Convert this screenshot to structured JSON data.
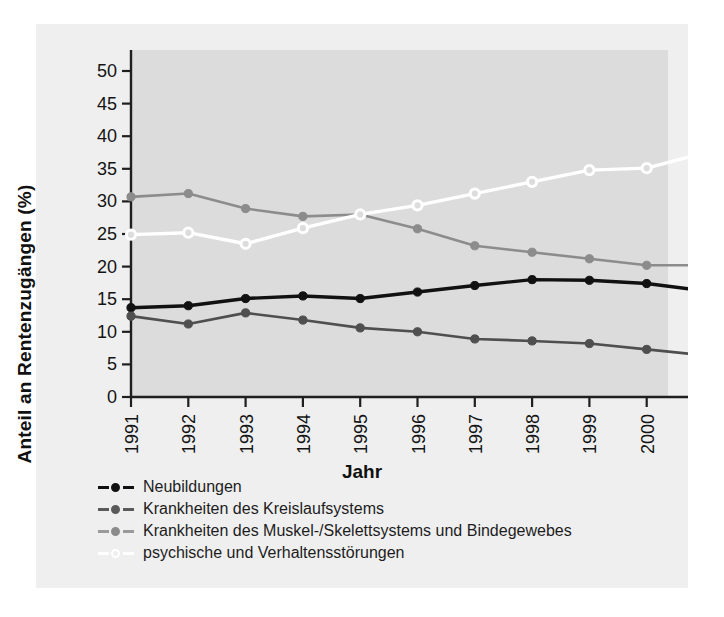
{
  "chart_data": {
    "type": "line",
    "title": "",
    "xlabel": "Jahr",
    "ylabel": "Anteil an Rentenzugängen (%)",
    "x": [
      1991,
      1992,
      1993,
      1994,
      1995,
      1996,
      1997,
      1998,
      1999,
      2000,
      2001
    ],
    "xticklabels": [
      "1991",
      "1992",
      "1993",
      "1994",
      "1995",
      "1996",
      "1997",
      "1998",
      "1999",
      "2000",
      "2001"
    ],
    "yticklabels": [
      "0",
      "5",
      "10",
      "15",
      "20",
      "25",
      "30",
      "35",
      "40",
      "45",
      "50"
    ],
    "yticks": [
      0,
      5,
      10,
      15,
      20,
      25,
      30,
      35,
      40,
      45,
      50
    ],
    "ylim": [
      0,
      50
    ],
    "grid": false,
    "legend_position": "below-axes",
    "series": [
      {
        "name": "Neubildungen",
        "color": "#111111",
        "marker": "filled-circle",
        "values": [
          13.7,
          14.0,
          15.1,
          15.5,
          15.1,
          16.1,
          17.1,
          18.0,
          17.9,
          17.4,
          16.3
        ]
      },
      {
        "name": "Krankheiten des Kreislaufsystems",
        "color": "#4f4f4f",
        "marker": "filled-circle",
        "values": [
          12.4,
          11.2,
          12.9,
          11.8,
          10.6,
          10.0,
          8.9,
          8.6,
          8.2,
          7.3,
          6.4
        ]
      },
      {
        "name": "Krankheiten des Muskel-/Skelettsystems und Bindegewebes",
        "color": "#8c8c8c",
        "marker": "filled-circle",
        "values": [
          30.7,
          31.2,
          28.9,
          27.7,
          28.0,
          25.8,
          23.2,
          22.2,
          21.2,
          20.2,
          20.2
        ]
      },
      {
        "name": "psychische und Verhaltensstörungen",
        "color": "#ffffff",
        "marker": "hollow-circle",
        "values": [
          24.9,
          25.2,
          23.5,
          25.9,
          28.0,
          29.4,
          31.2,
          33.0,
          34.8,
          35.1,
          37.4
        ]
      }
    ]
  },
  "legend": {
    "items": [
      "Neubildungen",
      "Krankheiten des Kreislaufsystems",
      "Krankheiten des Muskel-/Skelettsystems und Bindegewebes",
      "psychische und Verhaltensstörungen"
    ]
  },
  "colors": {
    "figure_background": "#efefef",
    "plot_background": "#dcdcdc",
    "axis": "#1f1f1f",
    "series_1": "#111111",
    "series_2": "#4f4f4f",
    "series_3": "#8c8c8c",
    "series_4": "#ffffff"
  }
}
